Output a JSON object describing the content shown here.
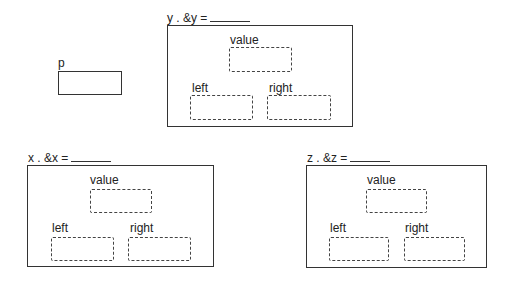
{
  "pointer": {
    "label": "p"
  },
  "nodes": [
    {
      "id": "y",
      "header": "y . &y =",
      "fields": {
        "value": "value",
        "left": "left",
        "right": "right"
      }
    },
    {
      "id": "x",
      "header": "x . &x =",
      "fields": {
        "value": "value",
        "left": "left",
        "right": "right"
      }
    },
    {
      "id": "z",
      "header": "z . &z =",
      "fields": {
        "value": "value",
        "left": "left",
        "right": "right"
      }
    }
  ]
}
